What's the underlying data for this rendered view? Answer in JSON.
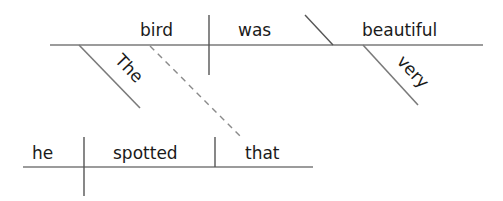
{
  "diagram": {
    "type": "sentence-diagram",
    "main_clause": {
      "subject": "bird",
      "verb": "was",
      "predicate_adjective": "beautiful",
      "subject_modifier": "The",
      "adjective_modifier": "very"
    },
    "relative_clause": {
      "subject": "he",
      "verb": "spotted",
      "object": "that",
      "connects_to": "bird"
    },
    "colors": {
      "text": "#1a1a1a",
      "lines": "#7a7a7a"
    }
  }
}
